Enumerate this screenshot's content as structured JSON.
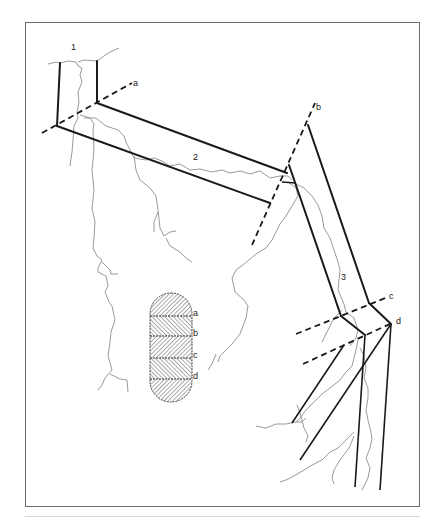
{
  "figure": {
    "segment_labels": [
      "1",
      "2",
      "3"
    ],
    "section_labels": [
      "a",
      "b",
      "c",
      "d"
    ],
    "legend": {
      "labels": [
        "a",
        "b",
        "c",
        "d"
      ]
    }
  },
  "colors": {
    "lines": "#1a1a1a",
    "cracks": "#9a9a9a",
    "frame": "#6e6e6e",
    "background": "#ffffff"
  }
}
